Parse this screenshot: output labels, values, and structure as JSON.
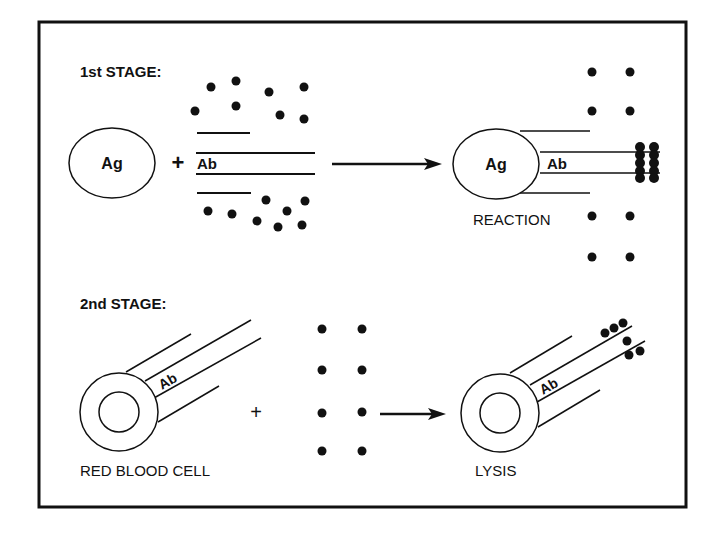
{
  "diagram": {
    "stage1": {
      "title": "1st STAGE:",
      "antigen_label": "Ag",
      "plus": "+",
      "antibody_label": "Ab",
      "result_antigen_label": "Ag",
      "result_antibody_label": "Ab",
      "result_caption": "REACTION"
    },
    "stage2": {
      "title": "2nd STAGE:",
      "antibody_label": "Ab",
      "cell_caption": "RED BLOOD CELL",
      "plus": "+",
      "result_antibody_label": "Ab",
      "result_caption": "LYSIS"
    },
    "colors": {
      "ink": "#111111",
      "background": "#ffffff"
    }
  }
}
